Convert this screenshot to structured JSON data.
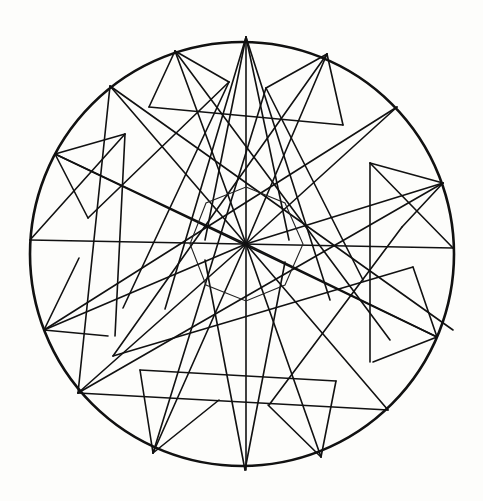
{
  "figure": {
    "width": 483,
    "height": 501,
    "stroke_color": "#111111",
    "background": "#fdfdfb",
    "circle": {
      "cx": 242,
      "cy": 254,
      "r": 212
    },
    "center": [
      246,
      244
    ],
    "outer_points": [
      [
        246,
        37
      ],
      [
        327,
        54
      ],
      [
        397,
        107
      ],
      [
        443,
        183
      ],
      [
        453,
        243
      ],
      [
        437,
        337
      ],
      [
        388,
        410
      ],
      [
        321,
        457
      ],
      [
        245,
        470
      ],
      [
        153,
        453
      ],
      [
        78,
        393
      ],
      [
        44,
        330
      ],
      [
        30,
        240
      ],
      [
        55,
        154
      ],
      [
        110,
        86
      ],
      [
        175,
        51
      ]
    ],
    "lines": [
      [
        246,
        37,
        246,
        470
      ],
      [
        30,
        240,
        453,
        248
      ],
      [
        246,
        37,
        205,
        240
      ],
      [
        246,
        37,
        289,
        240
      ],
      [
        246,
        37,
        165,
        309
      ],
      [
        246,
        37,
        330,
        300
      ],
      [
        245,
        470,
        205,
        260
      ],
      [
        245,
        470,
        285,
        262
      ],
      [
        110,
        86,
        453,
        330
      ],
      [
        397,
        107,
        44,
        330
      ],
      [
        55,
        154,
        437,
        337
      ],
      [
        443,
        183,
        78,
        393
      ],
      [
        110,
        86,
        246,
        244
      ],
      [
        397,
        107,
        246,
        244
      ],
      [
        55,
        154,
        246,
        244
      ],
      [
        443,
        183,
        246,
        244
      ],
      [
        44,
        330,
        246,
        244
      ],
      [
        437,
        337,
        246,
        244
      ],
      [
        78,
        393,
        246,
        244
      ],
      [
        388,
        410,
        246,
        244
      ],
      [
        175,
        51,
        246,
        244
      ],
      [
        327,
        54,
        246,
        244
      ],
      [
        153,
        453,
        246,
        244
      ],
      [
        321,
        457,
        246,
        244
      ],
      [
        175,
        51,
        229,
        82
      ],
      [
        175,
        51,
        149,
        107
      ],
      [
        149,
        107,
        343,
        125
      ],
      [
        175,
        51,
        390,
        340
      ],
      [
        327,
        54,
        266,
        88
      ],
      [
        327,
        54,
        343,
        125
      ],
      [
        266,
        88,
        153,
        453
      ],
      [
        327,
        54,
        113,
        356
      ],
      [
        55,
        154,
        125,
        134
      ],
      [
        55,
        154,
        88,
        218
      ],
      [
        125,
        134,
        115,
        336
      ],
      [
        443,
        183,
        370,
        163
      ],
      [
        443,
        183,
        402,
        227
      ],
      [
        370,
        163,
        370,
        362
      ],
      [
        44,
        330,
        79,
        258
      ],
      [
        44,
        330,
        108,
        336
      ],
      [
        437,
        337,
        413,
        267
      ],
      [
        437,
        337,
        373,
        362
      ],
      [
        78,
        393,
        388,
        410
      ],
      [
        110,
        86,
        78,
        393
      ],
      [
        140,
        370,
        153,
        453
      ],
      [
        140,
        370,
        336,
        381
      ],
      [
        336,
        381,
        321,
        457
      ],
      [
        153,
        453,
        219,
        400
      ],
      [
        321,
        457,
        268,
        405
      ],
      [
        229,
        82,
        88,
        218
      ],
      [
        402,
        227,
        269,
        405
      ],
      [
        113,
        356,
        413,
        267
      ],
      [
        266,
        88,
        363,
        280
      ],
      [
        229,
        82,
        123,
        308
      ],
      [
        30,
        240,
        125,
        134
      ],
      [
        453,
        248,
        370,
        163
      ]
    ],
    "inner_octagon": [
      [
        246,
        187
      ],
      [
        285,
        203
      ],
      [
        303,
        244
      ],
      [
        285,
        285
      ],
      [
        246,
        301
      ],
      [
        206,
        285
      ],
      [
        190,
        244
      ],
      [
        206,
        203
      ]
    ]
  }
}
